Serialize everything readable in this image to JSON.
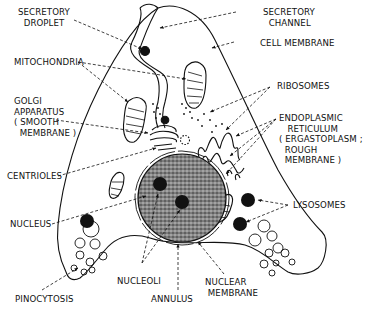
{
  "diagram": {
    "labels": {
      "secretory_droplet": "SECRETORY\n  DROPLET",
      "secretory_channel": "SECRETORY\n  CHANNEL",
      "cell_membrane": "CELL MEMBRANE",
      "mitochondria": "MITOCHONDRIA",
      "ribosomes": "RIBOSOMES",
      "golgi": "GOLGI\nAPPARATUS\n( SMOOTH\n  MEMBRANE )",
      "er": "ENDOPLASMIC\n   RETICULUM\n( ERGASTOPLASM ;\n  ROUGH\n  MEMBRANE )",
      "centrioles": "CENTRIOLES",
      "nucleus": "NUCLEUS",
      "lysosomes": "LYSOSOMES",
      "nucleoli": "NUCLEOLI",
      "nuclear_membrane": "NUCLEAR\n MEMBRANE",
      "annulus": "ANNULUS",
      "pinocytosis": "PINOCYTOSIS"
    },
    "colors": {
      "ink": "#111111",
      "background": "#ffffff",
      "nucleus_fill": "#6e6e6e"
    }
  }
}
